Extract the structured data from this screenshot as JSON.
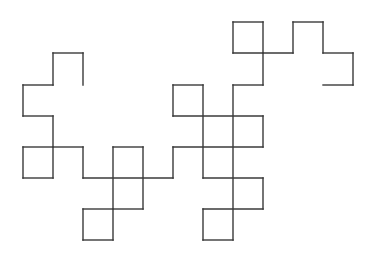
{
  "diagram": {
    "type": "fractal-path",
    "stroke_color": "#3a3a3a",
    "background": "#ffffff",
    "segments": [
      [
        53,
        53,
        83,
        53
      ],
      [
        83,
        53,
        83,
        85
      ],
      [
        53,
        53,
        53,
        85
      ],
      [
        23,
        85,
        53,
        85
      ],
      [
        23,
        85,
        23,
        116
      ],
      [
        23,
        116,
        53,
        116
      ],
      [
        53,
        116,
        53,
        178
      ],
      [
        23,
        147,
        53,
        147
      ],
      [
        23,
        147,
        23,
        178
      ],
      [
        23,
        178,
        53,
        178
      ],
      [
        53,
        147,
        83,
        147
      ],
      [
        83,
        147,
        83,
        178
      ],
      [
        83,
        178,
        173,
        178
      ],
      [
        113,
        147,
        143,
        147
      ],
      [
        113,
        147,
        113,
        240
      ],
      [
        143,
        147,
        143,
        209
      ],
      [
        113,
        209,
        143,
        209
      ],
      [
        83,
        209,
        113,
        209
      ],
      [
        83,
        209,
        83,
        240
      ],
      [
        83,
        240,
        113,
        240
      ],
      [
        173,
        147,
        173,
        178
      ],
      [
        173,
        147,
        263,
        147
      ],
      [
        173,
        85,
        203,
        85
      ],
      [
        173,
        85,
        173,
        116
      ],
      [
        173,
        116,
        263,
        116
      ],
      [
        203,
        85,
        203,
        178
      ],
      [
        263,
        116,
        263,
        147
      ],
      [
        203,
        178,
        263,
        178
      ],
      [
        263,
        178,
        263,
        209
      ],
      [
        203,
        209,
        263,
        209
      ],
      [
        203,
        209,
        203,
        240
      ],
      [
        203,
        240,
        233,
        240
      ],
      [
        233,
        85,
        233,
        240
      ],
      [
        233,
        85,
        263,
        85
      ],
      [
        263,
        53,
        263,
        85
      ],
      [
        233,
        22,
        263,
        22
      ],
      [
        233,
        22,
        233,
        53
      ],
      [
        233,
        53,
        293,
        53
      ],
      [
        263,
        22,
        263,
        53
      ],
      [
        293,
        22,
        293,
        53
      ],
      [
        293,
        22,
        323,
        22
      ],
      [
        323,
        22,
        323,
        53
      ],
      [
        323,
        53,
        353,
        53
      ],
      [
        353,
        53,
        353,
        85
      ],
      [
        323,
        85,
        353,
        85
      ]
    ]
  }
}
